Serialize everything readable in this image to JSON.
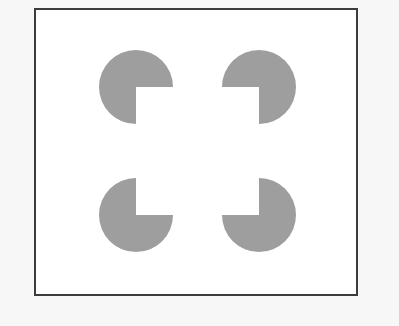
{
  "figure": {
    "name": "Kanizsa square illusion",
    "description": "Four gray pac-man shapes arranged at the corners of an invisible square, each with a quarter-circle wedge removed facing inward, producing an illusory white square.",
    "canvas": {
      "width": 399,
      "height": 326,
      "outer_background_color": "#f7f7f7"
    },
    "frame": {
      "name": "figure-border",
      "x": 34,
      "y": 8,
      "width": 324,
      "height": 288,
      "fill_color": "#ffffff",
      "stroke_color": "#3c3c3c",
      "stroke_width": 2
    },
    "inducers": {
      "shape_type": "pacman",
      "fill_color": "#9e9e9e",
      "radius": 37,
      "wedge_angle_degrees": 90,
      "count": 4,
      "items": [
        {
          "id": "inducer-top-left",
          "label": "Top-left pac-man",
          "cx": 136,
          "cy": 87,
          "missing_quadrant": "bottom-right",
          "wedge_start_angle": 0,
          "wedge_end_angle": 90
        },
        {
          "id": "inducer-top-right",
          "label": "Top-right pac-man",
          "cx": 259,
          "cy": 87,
          "missing_quadrant": "bottom-left",
          "wedge_start_angle": 90,
          "wedge_end_angle": 180
        },
        {
          "id": "inducer-bottom-left",
          "label": "Bottom-left pac-man",
          "cx": 136,
          "cy": 215,
          "missing_quadrant": "top-right",
          "wedge_start_angle": 270,
          "wedge_end_angle": 360
        },
        {
          "id": "inducer-bottom-right",
          "label": "Bottom-right pac-man",
          "cx": 259,
          "cy": 215,
          "missing_quadrant": "top-left",
          "wedge_start_angle": 180,
          "wedge_end_angle": 270
        }
      ]
    },
    "illusory_square": {
      "name": "illusory-contour-square",
      "visible": false,
      "x": 136,
      "y": 87,
      "width": 123,
      "height": 128
    }
  }
}
